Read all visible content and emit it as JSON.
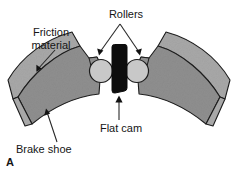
{
  "figure": {
    "panel_label": "A",
    "background_color": "#ffffff"
  },
  "labels": {
    "friction_material_line1": "Friction",
    "friction_material_line2": "material",
    "rollers": "Rollers",
    "flat_cam": "Flat cam",
    "brake_shoe": "Brake shoe"
  },
  "colors": {
    "friction_material": "#a8a8a8",
    "brake_shoe_body": "#8f8f8f",
    "roller": "#c8c8c8",
    "flat_cam": "#0d0d0d",
    "outline": "#1c1c1c",
    "leader_line": "#2a2a2a",
    "text": "#151515"
  },
  "parts": [
    {
      "name": "friction-material",
      "label": "Friction material",
      "count": 2
    },
    {
      "name": "brake-shoe",
      "label": "Brake shoe",
      "count": 2
    },
    {
      "name": "roller",
      "label": "Rollers",
      "count": 2
    },
    {
      "name": "flat-cam",
      "label": "Flat cam",
      "count": 1
    }
  ]
}
